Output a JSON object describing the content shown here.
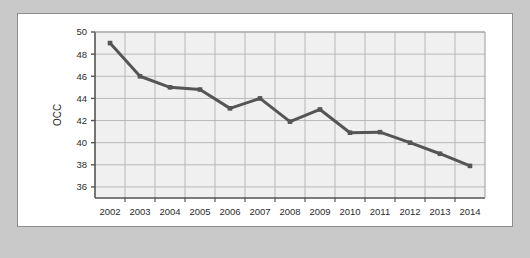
{
  "figure": {
    "frame_color": "#c9c9c9",
    "canvas_color": "#ffffff",
    "border_color": "#8d8d8d"
  },
  "chart_data": {
    "type": "line",
    "title": "",
    "subtitle": "",
    "xlabel": "",
    "ylabel": "OCC",
    "x": [
      2002,
      2003,
      2004,
      2005,
      2006,
      2007,
      2008,
      2009,
      2010,
      2011,
      2012,
      2013,
      2014
    ],
    "categories": [
      "2002",
      "2003",
      "2004",
      "2005",
      "2006",
      "2007",
      "2008",
      "2009",
      "2010",
      "2011",
      "2012",
      "2013",
      "2014"
    ],
    "values": [
      49.0,
      46.0,
      45.0,
      44.8,
      43.1,
      44.0,
      41.9,
      43.0,
      40.9,
      40.95,
      40.0,
      39.0,
      37.9
    ],
    "series": [
      {
        "name": "OCC",
        "values": [
          49.0,
          46.0,
          45.0,
          44.8,
          43.1,
          44.0,
          41.9,
          43.0,
          40.9,
          40.95,
          40.0,
          39.0,
          37.9
        ],
        "color": "#555555",
        "marker": "square",
        "line_width": 3
      }
    ],
    "ylim": [
      35,
      50
    ],
    "yticks": [
      36,
      38,
      40,
      42,
      44,
      46,
      48,
      50
    ],
    "ytick_labels": [
      "36",
      "38",
      "40",
      "42",
      "44",
      "46",
      "48",
      "50"
    ],
    "xtick_labels": [
      "2002",
      "2003",
      "2004",
      "2005",
      "2006",
      "2007",
      "2008",
      "2009",
      "2010",
      "2011",
      "2012",
      "2013",
      "2014"
    ],
    "grid": true,
    "grid_color": "#b8b8b8",
    "plot_bg": "#f0f0f0",
    "axis_color": "#555555",
    "legend": null,
    "legend_position": "none",
    "annotations": []
  }
}
